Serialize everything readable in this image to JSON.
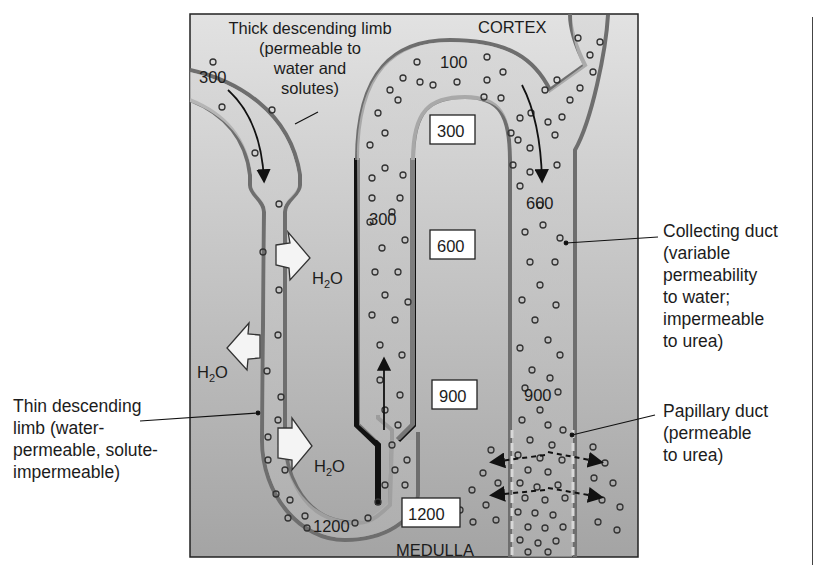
{
  "diagram": {
    "regions": {
      "top": "CORTEX",
      "bottom": "MEDULLA"
    },
    "interstitial_osmolarity_boxes": [
      "300",
      "600",
      "900",
      "1200"
    ],
    "tubule_values": {
      "descending_entry": "300",
      "thick_ascending_top": "100",
      "ascending_mid": "300",
      "collecting_duct_upper": "600",
      "collecting_duct_lower": "900",
      "loop_bottom": "1200"
    },
    "water_labels": [
      "H2O",
      "H2O",
      "H2O"
    ],
    "labels": {
      "thick_descending": "Thick descending limb\n(permeable to\nwater and\nsolutes)",
      "thin_descending": "Thin descending\nlimb (water-\npermeable, solute-\nimpermeable)",
      "collecting_duct": "Collecting duct\n(variable\npermeability\nto water;\nimpermeable\nto urea)",
      "papillary_duct": "Papillary duct\n(permeable\nto urea)"
    },
    "colors": {
      "background_top": "#dedede",
      "background_bottom": "#a9a9a9",
      "tubule_wall": "#6e6e6e",
      "thick_wall": "#111111",
      "tubule_fill": "#c8c8c8",
      "text": "#1c1c1c"
    }
  }
}
